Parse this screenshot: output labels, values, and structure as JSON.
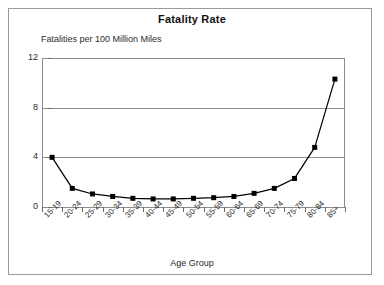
{
  "figure": {
    "title": "Fatality Rate",
    "y_caption": "Fatalities per 100 Million Miles",
    "x_title": "Age Group",
    "frame_color": "#9a9a9a",
    "grid_color": "#8c8c8c",
    "series_color": "#000000"
  },
  "chart_data": {
    "type": "line",
    "title": "Fatality Rate",
    "subtitle": "Fatalities per 100 Million Miles",
    "xlabel": "Age Group",
    "ylabel": "Fatalities per 100 Million Miles",
    "categories": [
      "15-19",
      "20-24",
      "25-29",
      "30-34",
      "35-39",
      "40-44",
      "45-49",
      "50-54",
      "55-59",
      "60-64",
      "65-69",
      "70-74",
      "75-79",
      "80-84",
      "85+"
    ],
    "values": [
      4.0,
      1.5,
      1.05,
      0.85,
      0.7,
      0.65,
      0.65,
      0.7,
      0.75,
      0.85,
      1.1,
      1.5,
      2.3,
      4.8,
      10.3
    ],
    "ylim": [
      0,
      12
    ],
    "yticks": [
      0,
      4,
      8,
      12
    ],
    "ytick_labels": [
      "0",
      "4",
      "8",
      "12"
    ],
    "grid": true,
    "grid_axis": "y",
    "legend": false,
    "marker": "square",
    "marker_color": "#000000",
    "line_color": "#000000"
  }
}
